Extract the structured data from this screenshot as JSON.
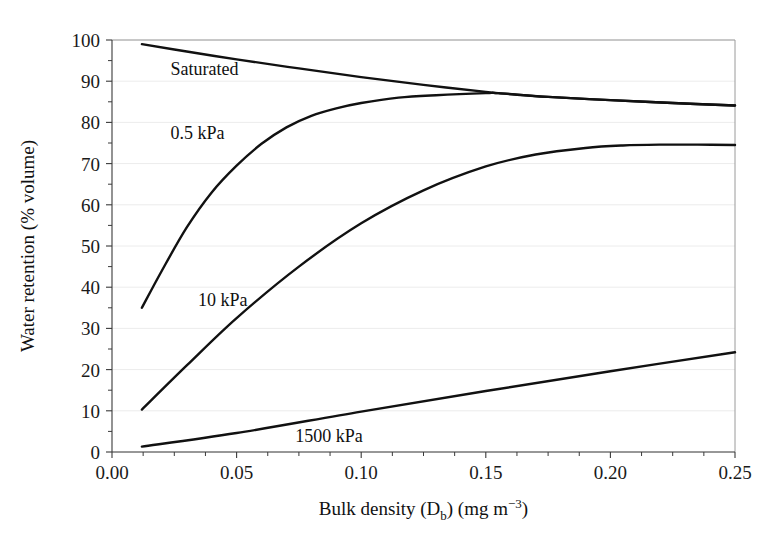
{
  "chart_data": {
    "type": "line",
    "title": "",
    "xlabel_parts": {
      "main": "Bulk density (D",
      "sub": "b",
      "tail": ") (mg m",
      "sup": "−3",
      "end": ")"
    },
    "xlabel": "Bulk density (Db) (mg m−3)",
    "ylabel": "Water retention (% volume)",
    "xlim": [
      0.0,
      0.25
    ],
    "ylim": [
      0,
      100
    ],
    "xticks": [
      0.0,
      0.05,
      0.1,
      0.15,
      0.2,
      0.25
    ],
    "xtick_labels": [
      "0.00",
      "0.05",
      "0.10",
      "0.15",
      "0.20",
      "0.25"
    ],
    "yticks": [
      0,
      10,
      20,
      30,
      40,
      50,
      60,
      70,
      80,
      90,
      100
    ],
    "ytick_labels": [
      "0",
      "10",
      "20",
      "30",
      "40",
      "50",
      "60",
      "70",
      "80",
      "90",
      "100"
    ],
    "x_minor_step": 0.0125,
    "y_minor_step": 5,
    "grid": "y-major-faint",
    "legend_position": "inline-annotations",
    "line_color": "#111111",
    "series": [
      {
        "name": "Saturated",
        "label": "Saturated",
        "label_x": 0.0235,
        "label_y": 93.0,
        "x": [
          0.012,
          0.025,
          0.05,
          0.075,
          0.1,
          0.125,
          0.15,
          0.155,
          0.175,
          0.2,
          0.225,
          0.25
        ],
        "values": [
          99.0,
          97.7,
          95.3,
          93.1,
          91.0,
          89.1,
          87.4,
          87.1,
          86.2,
          85.4,
          84.7,
          84.1
        ]
      },
      {
        "name": "0.5 kPa",
        "label": "0.5 kPa",
        "label_x": 0.0235,
        "label_y": 77.5,
        "x": [
          0.012,
          0.02,
          0.03,
          0.04,
          0.05,
          0.06,
          0.07,
          0.08,
          0.09,
          0.1,
          0.115,
          0.13,
          0.15,
          0.155,
          0.175,
          0.2,
          0.225,
          0.25
        ],
        "values": [
          35.0,
          44.0,
          54.5,
          63.0,
          69.5,
          74.8,
          78.8,
          81.6,
          83.4,
          84.7,
          86.0,
          86.6,
          87.1,
          87.1,
          86.2,
          85.4,
          84.7,
          84.1
        ]
      },
      {
        "name": "10 kPa",
        "label": "10 kPa",
        "label_x": 0.0345,
        "label_y": 37.0,
        "x": [
          0.012,
          0.03,
          0.05,
          0.075,
          0.1,
          0.125,
          0.15,
          0.17,
          0.19,
          0.205,
          0.22,
          0.235,
          0.25
        ],
        "values": [
          10.3,
          21.0,
          32.5,
          45.0,
          55.5,
          63.5,
          69.3,
          72.2,
          73.8,
          74.4,
          74.6,
          74.6,
          74.5
        ]
      },
      {
        "name": "1500 kPa",
        "label": "1500 kPa",
        "label_x": 0.0735,
        "label_y": 3.8,
        "x": [
          0.012,
          0.05,
          0.1,
          0.15,
          0.2,
          0.25
        ],
        "values": [
          1.3,
          4.6,
          9.8,
          14.8,
          19.6,
          24.2
        ]
      }
    ]
  }
}
